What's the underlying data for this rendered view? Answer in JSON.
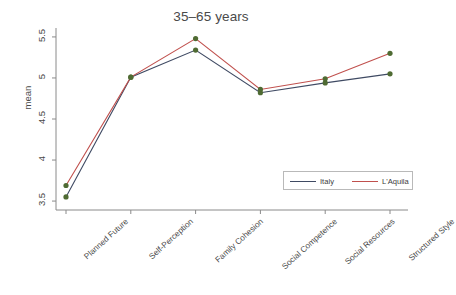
{
  "chart_data": {
    "type": "line",
    "title": "35–65 years",
    "xlabel": "",
    "ylabel": "mean",
    "categories": [
      "Planned Future",
      "Self-Perception",
      "Family Cohesion",
      "Social Competence",
      "Social Resources",
      "Structured Style"
    ],
    "series": [
      {
        "name": "Italy",
        "color": "#3f4a63",
        "marker_color": "#4f6b33",
        "values": [
          3.55,
          5.01,
          5.34,
          4.82,
          4.94,
          5.05
        ]
      },
      {
        "name": "L'Aquila",
        "color": "#c0504d",
        "marker_color": "#4f6b33",
        "values": [
          3.69,
          5.01,
          5.48,
          4.86,
          4.99,
          5.3
        ]
      }
    ],
    "yticks": [
      "3.5",
      "4",
      "4.5",
      "5",
      "5.5"
    ],
    "ytick_values": [
      3.5,
      4,
      4.5,
      5,
      5.5
    ],
    "ylim": [
      3.44,
      5.56
    ],
    "grid": false,
    "legend_position": "bottom-right",
    "legend_entries": [
      "Italy",
      "L'Aquila"
    ]
  }
}
